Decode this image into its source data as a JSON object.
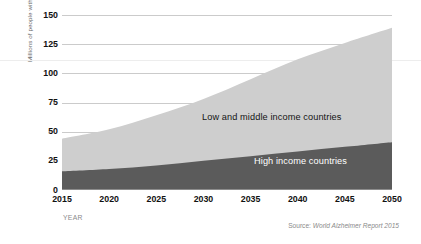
{
  "chart_data": {
    "type": "area",
    "stacked": true,
    "title": "",
    "subtitle": "",
    "xlabel": "YEAR",
    "ylabel": "Millions of people with dementia",
    "x": [
      2015,
      2020,
      2025,
      2030,
      2035,
      2040,
      2045,
      2050
    ],
    "categories": [
      "2015",
      "2020",
      "2025",
      "2030",
      "2035",
      "2040",
      "2045",
      "2050"
    ],
    "xlim": [
      2015,
      2050
    ],
    "ylim": [
      0,
      150
    ],
    "yticks": [
      0,
      25,
      50,
      75,
      100,
      125,
      150
    ],
    "ytick_labels": [
      "0",
      "25",
      "50",
      "75",
      "100",
      "125",
      "150"
    ],
    "xticks": [
      2015,
      2020,
      2025,
      2030,
      2035,
      2040,
      2045,
      2050
    ],
    "xtick_labels": [
      "2015",
      "2020",
      "2025",
      "2030",
      "2035",
      "2040",
      "2045",
      "2050"
    ],
    "grid": true,
    "grid_axis": "y",
    "legend": "in-plot annotations",
    "series": [
      {
        "name": "High income countries",
        "color": "#5b5b5b",
        "values": [
          16,
          18,
          21,
          25,
          29,
          33,
          37,
          41
        ]
      },
      {
        "name": "Low and middle income countries",
        "color": "#cecece",
        "values": [
          28,
          34,
          43,
          53,
          66,
          79,
          89,
          98
        ]
      }
    ],
    "totals": [
      44,
      52,
      64,
      78,
      95,
      112,
      126,
      139
    ],
    "annotations": [
      {
        "text": "Low and middle income countries",
        "series": "Low and middle income countries"
      },
      {
        "text": "High income countries",
        "series": "High income countries"
      }
    ]
  },
  "axes": {
    "y_title": "Millions of people with dementia",
    "x_title": "YEAR",
    "y_ticks": [
      "150",
      "125",
      "100",
      "75",
      "50",
      "25",
      "0"
    ],
    "x_ticks": [
      "2015",
      "2020",
      "2025",
      "2030",
      "2035",
      "2040",
      "2045",
      "2050"
    ]
  },
  "labels": {
    "low_middle": "Low and middle income countries",
    "high": "High income countries"
  },
  "source": {
    "prefix": "Source:",
    "reference": "World Alzheimer Report 2015"
  },
  "colors": {
    "high_income": "#5b5b5b",
    "low_middle_income": "#cecece",
    "gridline": "#b9b9b9",
    "background": "#ffffff"
  }
}
